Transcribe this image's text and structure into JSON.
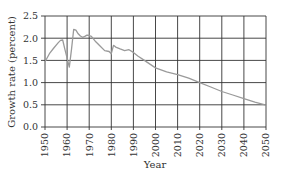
{
  "chart_data": {
    "type": "line",
    "title": "",
    "xlabel": "Year",
    "ylabel": "Growth rate (percent)",
    "xlim": [
      1950,
      2050
    ],
    "ylim": [
      0.0,
      2.5
    ],
    "grid": true,
    "legend": null,
    "x_ticks": [
      "1950",
      "1960",
      "1970",
      "1980",
      "1990",
      "2000",
      "2010",
      "2020",
      "2030",
      "2040",
      "2050"
    ],
    "y_ticks": [
      "0.0",
      "0.5",
      "1.0",
      "1.5",
      "2.0",
      "2.5"
    ],
    "series": [
      {
        "name": "World population growth rate",
        "color": "#9a9a9a",
        "x": [
          1950,
          1952,
          1954,
          1956,
          1957,
          1958,
          1959,
          1960,
          1961,
          1962,
          1963,
          1964,
          1965,
          1966,
          1967,
          1968,
          1969,
          1970,
          1971,
          1972,
          1973,
          1975,
          1977,
          1979,
          1980,
          1981,
          1982,
          1984,
          1986,
          1988,
          1990,
          1992,
          1995,
          2000,
          2005,
          2010,
          2015,
          2020,
          2025,
          2030,
          2035,
          2040,
          2045,
          2050
        ],
        "values": [
          1.47,
          1.65,
          1.78,
          1.9,
          1.95,
          1.96,
          1.75,
          1.55,
          1.35,
          1.75,
          2.2,
          2.18,
          2.1,
          2.05,
          2.02,
          2.04,
          2.07,
          2.06,
          2.04,
          1.98,
          1.92,
          1.82,
          1.72,
          1.7,
          1.65,
          1.84,
          1.8,
          1.76,
          1.72,
          1.74,
          1.68,
          1.6,
          1.5,
          1.33,
          1.24,
          1.18,
          1.1,
          1.0,
          0.9,
          0.8,
          0.72,
          0.64,
          0.56,
          0.49
        ]
      }
    ]
  }
}
